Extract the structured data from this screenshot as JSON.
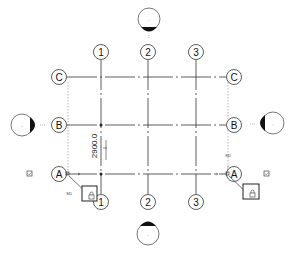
{
  "drawing": {
    "grid_columns": [
      {
        "label": "1",
        "x": 101
      },
      {
        "label": "2",
        "x": 148
      },
      {
        "label": "3",
        "x": 196
      }
    ],
    "grid_rows": [
      {
        "label": "C",
        "y": 77
      },
      {
        "label": "B",
        "y": 125
      },
      {
        "label": "A",
        "y": 174
      }
    ],
    "dimension": {
      "value": "2900.0"
    },
    "elevation_markers": [
      {
        "id": "north",
        "label": "-"
      },
      {
        "id": "south",
        "label": "-"
      },
      {
        "id": "west",
        "label": "-"
      },
      {
        "id": "east",
        "label": "-"
      }
    ],
    "tags": {
      "sd_left": "SD",
      "sd_right": "SD"
    },
    "colors": {
      "line": "#222222",
      "dashed": "#888888",
      "background": "#ffffff"
    }
  }
}
